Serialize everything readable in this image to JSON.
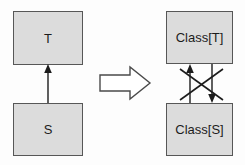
{
  "diagram": {
    "background_color": "#fdfdfd",
    "box_fill_color": "#dcdcdc",
    "box_border_color": "#575757",
    "line_color": "#1c1c1c",
    "block_arrow_fill": "#ffffff",
    "block_arrow_border": "#4a4a4a"
  },
  "left_side": {
    "name": "source-model",
    "boxes": [
      {
        "id": "t",
        "label": "T",
        "position": "top"
      },
      {
        "id": "s",
        "label": "S",
        "position": "bottom"
      }
    ],
    "connector": {
      "name": "inheritance-arrow",
      "from": "S",
      "to": "T",
      "direction": "up",
      "arrowhead": "solid-filled",
      "style": "solid-line"
    }
  },
  "transform": {
    "name": "transform-block-arrow",
    "shape": "hollow-block-arrow",
    "direction": "right",
    "label": ""
  },
  "right_side": {
    "name": "target-model",
    "boxes": [
      {
        "id": "class-t",
        "label": "Class[T]",
        "position": "top"
      },
      {
        "id": "class-s",
        "label": "Class[S]",
        "position": "bottom"
      }
    ],
    "connectors": [
      {
        "name": "association-up-arrow",
        "from": "Class[S]",
        "to": "Class[T]",
        "direction": "up",
        "arrowhead": "solid-filled",
        "style": "solid-line"
      },
      {
        "name": "association-down-arrow",
        "from": "Class[T]",
        "to": "Class[S]",
        "direction": "down",
        "arrowhead": "solid-filled",
        "style": "solid-line"
      },
      {
        "name": "cross-mark-stroke-one",
        "direction": "diagonal-down-right",
        "style": "solid-line"
      },
      {
        "name": "cross-mark-stroke-two",
        "direction": "diagonal-up-right",
        "style": "solid-line"
      }
    ]
  }
}
